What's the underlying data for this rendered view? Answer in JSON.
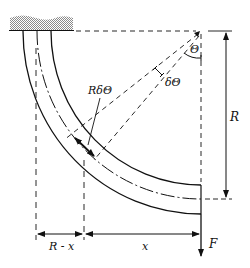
{
  "diagram": {
    "type": "curved-beam-free-body",
    "colors": {
      "line": "#111111",
      "wall_hatch": "#9a9a9a",
      "background": "#ffffff"
    },
    "labels": {
      "theta": "Θ",
      "delta_theta": "δΘ",
      "arc_element": "RδΘ",
      "radius": "R",
      "r_minus_x": "R - x",
      "x": "x",
      "force": "F"
    },
    "geometry": {
      "center": [
        200,
        31
      ],
      "outer_radius": 180,
      "centerline_radius": 166,
      "inner_radius": 152
    }
  }
}
